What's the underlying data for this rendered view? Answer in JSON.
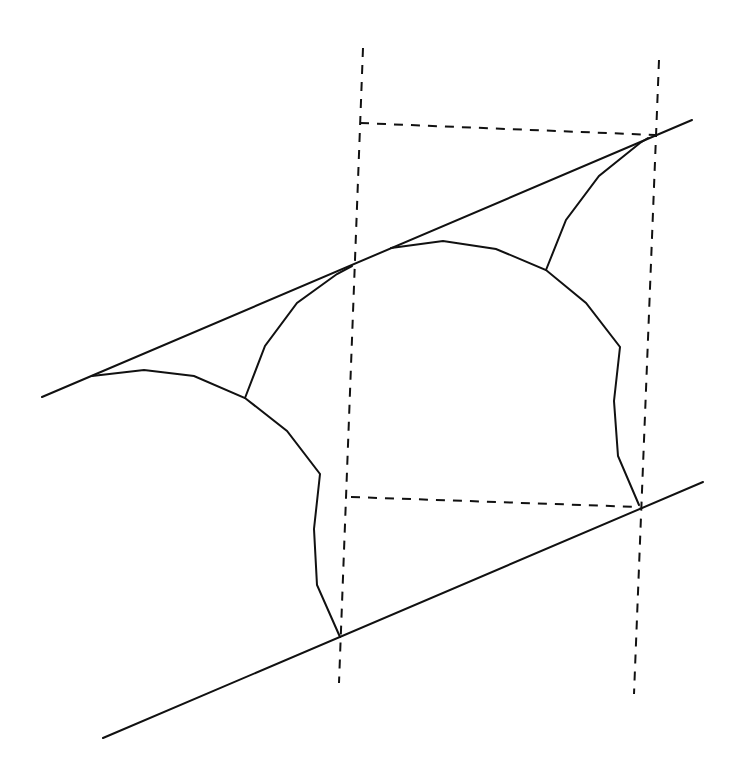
{
  "diagram": {
    "canvas": {
      "width": 740,
      "height": 777,
      "background": "#ffffff",
      "stroke": "#111111"
    },
    "solid_lines": [
      {
        "name": "upper-tangent-line",
        "points": "42,397 692,120"
      },
      {
        "name": "lower-tangent-line",
        "points": "103,738 703,482"
      }
    ],
    "dashed_lines": [
      {
        "name": "left-vertical-guide",
        "points": "363,48 339,683"
      },
      {
        "name": "right-vertical-guide",
        "points": "659,60 634,694"
      },
      {
        "name": "upper-horizontal-guide",
        "points": "360,123 655,135"
      },
      {
        "name": "lower-horizontal-guide",
        "points": "351,497 640,507"
      }
    ],
    "profile_curves": [
      {
        "name": "left-arc-profile",
        "points": "92,376 144,370 194,376 245,398 287,431 320,474 314,529 317,585 340,637"
      },
      {
        "name": "left-cusp-fillet",
        "points": "245,398 265,346 297,303 337,274 352,266"
      },
      {
        "name": "right-arc-profile",
        "points": "391,248 443,241 496,249 546,270 586,303 620,347 614,401 618,456 639,505"
      },
      {
        "name": "right-cusp-fillet",
        "points": "546,270 566,220 599,176 640,143 648,138"
      }
    ]
  }
}
